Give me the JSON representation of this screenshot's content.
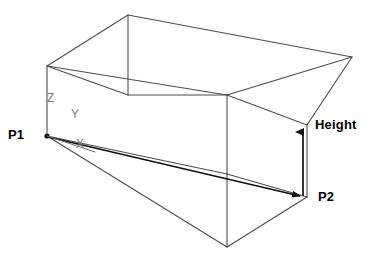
{
  "diagram": {
    "type": "wireframe-isometric-box",
    "canvas": {
      "width": 378,
      "height": 266,
      "background": "#ffffff"
    },
    "colors": {
      "edge_stroke": "#4d4d4d",
      "measure_stroke": "#111111",
      "label_text": "#000000",
      "axis_label_text": "#7a7a7a",
      "background": "#ffffff"
    },
    "points": {
      "p1": {
        "label": "P1",
        "x": 47,
        "y": 136
      },
      "p2": {
        "label": "P2",
        "x": 307,
        "y": 197
      }
    },
    "measurements": {
      "height": {
        "label": "Height",
        "from_y": 197,
        "to_y": 126,
        "x": 303
      },
      "diagonal": {
        "from": "P1",
        "to": "P2"
      }
    },
    "axes": [
      {
        "name": "z-axis",
        "label": "Z"
      },
      {
        "name": "y-axis",
        "label": "Y"
      },
      {
        "name": "x-axis",
        "label": "X"
      }
    ],
    "box_vertices": {
      "top_back_left": {
        "x": 128,
        "y": 15
      },
      "top_front_left": {
        "x": 47,
        "y": 66
      },
      "top_mid_inner": {
        "x": 227,
        "y": 95
      },
      "top_back_right": {
        "x": 388,
        "y": 75
      },
      "top_front_right": {
        "x": 307,
        "y": 125
      },
      "bot_front_left": {
        "x": 47,
        "y": 136
      },
      "bot_mid_inner": {
        "x": 227,
        "y": 174
      },
      "bot_front_mid": {
        "x": 227,
        "y": 247
      },
      "bot_front_right": {
        "x": 307,
        "y": 197
      }
    }
  }
}
